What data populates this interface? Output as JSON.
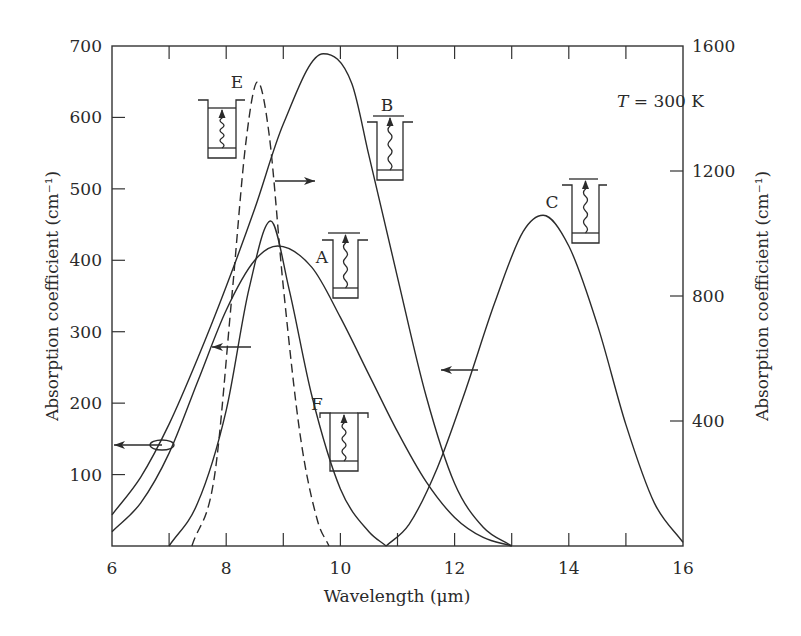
{
  "chart_data": {
    "type": "line",
    "title": "",
    "xlabel": "Wavelength (μm)",
    "ylabel_left": "Absorption coefficient (cm⁻¹)",
    "ylabel_right": "Absorption coefficient (cm⁻¹)",
    "xlim": [
      6,
      16
    ],
    "ylim_left": [
      0,
      700
    ],
    "ylim_right": [
      0,
      1600
    ],
    "x_ticks": [
      6,
      8,
      10,
      12,
      14,
      16
    ],
    "x_minor_ticks": [
      7,
      9,
      11,
      13,
      15
    ],
    "y_left_ticks": [
      100,
      200,
      300,
      400,
      500,
      600,
      700
    ],
    "y_right_ticks": [
      400,
      800,
      1200,
      1600
    ],
    "grid": false,
    "annotation": "T = 300 K",
    "series": [
      {
        "name": "A",
        "axis": "left",
        "style": "solid",
        "peak_x": 8.9,
        "peak_y": 420,
        "points": [
          [
            6.0,
            20
          ],
          [
            6.5,
            60
          ],
          [
            7.0,
            130
          ],
          [
            7.5,
            230
          ],
          [
            8.0,
            330
          ],
          [
            8.5,
            400
          ],
          [
            8.9,
            420
          ],
          [
            9.5,
            390
          ],
          [
            10.0,
            320
          ],
          [
            10.5,
            240
          ],
          [
            11.0,
            160
          ],
          [
            11.5,
            90
          ],
          [
            12.0,
            40
          ],
          [
            12.5,
            12
          ],
          [
            13.0,
            0
          ]
        ]
      },
      {
        "name": "B",
        "axis": "right",
        "style": "solid",
        "peak_x": 9.7,
        "peak_y": 1575,
        "points": [
          [
            6.0,
            100
          ],
          [
            6.5,
            220
          ],
          [
            7.0,
            390
          ],
          [
            7.5,
            600
          ],
          [
            8.0,
            830
          ],
          [
            8.5,
            1080
          ],
          [
            9.0,
            1350
          ],
          [
            9.7,
            1575
          ],
          [
            10.2,
            1480
          ],
          [
            10.5,
            1250
          ],
          [
            11.0,
            860
          ],
          [
            11.5,
            480
          ],
          [
            12.0,
            200
          ],
          [
            12.5,
            60
          ],
          [
            13.0,
            0
          ]
        ]
      },
      {
        "name": "C",
        "axis": "left",
        "style": "solid",
        "peak_x": 13.55,
        "peak_y": 463,
        "points": [
          [
            10.8,
            0
          ],
          [
            11.2,
            30
          ],
          [
            11.7,
            110
          ],
          [
            12.2,
            220
          ],
          [
            12.7,
            340
          ],
          [
            13.2,
            440
          ],
          [
            13.55,
            463
          ],
          [
            14.0,
            420
          ],
          [
            14.5,
            310
          ],
          [
            15.0,
            170
          ],
          [
            15.5,
            60
          ],
          [
            16.0,
            5
          ]
        ]
      },
      {
        "name": "E",
        "axis": "right",
        "style": "dashed",
        "peak_x": 8.55,
        "peak_y": 1485,
        "points": [
          [
            7.4,
            0
          ],
          [
            7.8,
            230
          ],
          [
            8.1,
            800
          ],
          [
            8.35,
            1300
          ],
          [
            8.55,
            1485
          ],
          [
            8.75,
            1320
          ],
          [
            9.0,
            830
          ],
          [
            9.3,
            350
          ],
          [
            9.6,
            80
          ],
          [
            9.8,
            0
          ]
        ]
      },
      {
        "name": "F",
        "axis": "left",
        "style": "solid",
        "peak_x": 8.78,
        "peak_y": 455,
        "points": [
          [
            7.0,
            0
          ],
          [
            7.5,
            60
          ],
          [
            8.0,
            190
          ],
          [
            8.4,
            360
          ],
          [
            8.78,
            455
          ],
          [
            9.1,
            360
          ],
          [
            9.5,
            210
          ],
          [
            10.0,
            80
          ],
          [
            10.5,
            20
          ],
          [
            10.8,
            0
          ]
        ]
      }
    ],
    "axis_indicators": [
      {
        "direction": "left",
        "target": "A/B (circled)",
        "meaning": "left axis"
      },
      {
        "direction": "left",
        "target": "F",
        "meaning": "left axis"
      },
      {
        "direction": "right",
        "target": "E",
        "meaning": "right axis"
      },
      {
        "direction": "left",
        "target": "C",
        "meaning": "left axis"
      }
    ],
    "quantum_well_insets": [
      "A",
      "B",
      "C",
      "E",
      "F"
    ]
  },
  "labels": {
    "temperature_prefix": "T",
    "temperature_value": " = 300 K"
  }
}
